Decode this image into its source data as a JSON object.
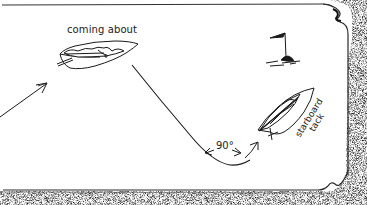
{
  "diagram": {
    "type": "sailing-maneuver-illustration",
    "labels": {
      "coming_about": "coming about",
      "angle": "90°",
      "starboard": "starboard",
      "tack": "tack"
    },
    "elements": [
      {
        "name": "incoming-course-arrow",
        "description": "arrow approaching from lower left toward the boat"
      },
      {
        "name": "boat-coming-about",
        "description": "sailboat with luffing sail, labeled 'coming about'"
      },
      {
        "name": "course-path",
        "description": "curved track from the coming-about boat down and up to the starboard-tack boat"
      },
      {
        "name": "angle-indicator",
        "description": "double-headed arc marking a 90° turn"
      },
      {
        "name": "boat-starboard-tack",
        "description": "sailboat heeled, pointing up-right, labeled 'starboard tack'"
      },
      {
        "name": "flag-buoy",
        "description": "mark buoy with pennant flag in the upper right"
      },
      {
        "name": "frame-border",
        "description": "stippled drop-shadow frame with curled corner at right"
      }
    ],
    "colors": {
      "ink": "#1a1a1a",
      "background": "#ffffff",
      "shadow": "#555555"
    }
  }
}
